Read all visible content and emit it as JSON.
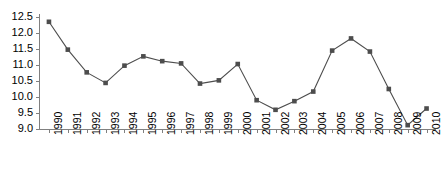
{
  "chart_data": {
    "type": "line",
    "title": "",
    "subtitle": "",
    "xlabel": "",
    "ylabel": "",
    "categories": [
      "1990",
      "1991",
      "1992",
      "1993",
      "1994",
      "1995",
      "1996",
      "1997",
      "1998",
      "1999",
      "2000",
      "2001",
      "2002",
      "2003",
      "2004",
      "2005",
      "2006",
      "2007",
      "2008",
      "2009",
      "2010"
    ],
    "values": [
      12.35,
      11.48,
      10.77,
      10.44,
      10.98,
      11.27,
      11.12,
      11.05,
      10.42,
      10.52,
      11.03,
      9.9,
      9.6,
      9.87,
      10.17,
      11.45,
      11.83,
      11.42,
      10.25,
      9.12,
      9.64
    ],
    "x": [
      1990,
      1991,
      1992,
      1993,
      1994,
      1995,
      1996,
      1997,
      1998,
      1999,
      2000,
      2001,
      2002,
      2003,
      2004,
      2005,
      2006,
      2007,
      2008,
      2009,
      2010
    ],
    "ylim": [
      9.0,
      12.5
    ],
    "ytick_values": [
      9.0,
      9.5,
      10.0,
      10.5,
      11.0,
      11.5,
      12.0,
      12.5
    ],
    "ytick_labels": [
      "9.0",
      "9.5",
      "10.0",
      "10.5",
      "11.0",
      "11.5",
      "12.0",
      "12.5"
    ],
    "grid": false,
    "legend": [],
    "legend_position": "none",
    "marker": "square",
    "series_color": "#4d4d4d",
    "line_color": "#4d4d4d",
    "axis_color": "#808080"
  }
}
